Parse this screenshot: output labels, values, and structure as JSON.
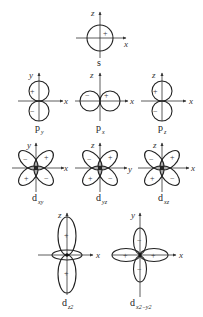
{
  "figure": {
    "orbitals": [
      {
        "name": "s",
        "label_main": "s",
        "label_sub": "",
        "axes": [
          "x",
          "z"
        ],
        "signs": [
          "+"
        ]
      },
      {
        "name": "py",
        "label_main": "p",
        "label_sub": "y",
        "axes": [
          "x",
          "y"
        ],
        "signs": [
          "+",
          "−"
        ]
      },
      {
        "name": "px",
        "label_main": "p",
        "label_sub": "x",
        "axes": [
          "x",
          "z"
        ],
        "signs": [
          "−",
          "+"
        ]
      },
      {
        "name": "pz",
        "label_main": "p",
        "label_sub": "z",
        "axes": [
          "x",
          "z"
        ],
        "signs": [
          "+",
          "−"
        ]
      },
      {
        "name": "dxy",
        "label_main": "d",
        "label_sub": "xy",
        "axes": [
          "x",
          "y"
        ],
        "signs": [
          "−",
          "+",
          "+",
          "−"
        ]
      },
      {
        "name": "dyz",
        "label_main": "d",
        "label_sub": "yz",
        "axes": [
          "y",
          "z"
        ],
        "signs": [
          "−",
          "+",
          "+",
          "−"
        ]
      },
      {
        "name": "dxz",
        "label_main": "d",
        "label_sub": "xz",
        "axes": [
          "x",
          "z"
        ],
        "signs": [
          "−",
          "+",
          "+",
          "−"
        ]
      },
      {
        "name": "dz2",
        "label_main": "d",
        "label_sub": "z2",
        "axes": [
          "x",
          "z"
        ],
        "signs": [
          "+",
          "−",
          "+"
        ]
      },
      {
        "name": "dx2y2",
        "label_main": "d",
        "label_sub": "x2−y2",
        "axes": [
          "x",
          "y"
        ],
        "signs": [
          "−",
          "+",
          "+",
          "−"
        ]
      }
    ],
    "axis_labels": {
      "x": "x",
      "y": "y",
      "z": "z"
    },
    "signs": {
      "plus": "+",
      "minus": "−"
    }
  }
}
